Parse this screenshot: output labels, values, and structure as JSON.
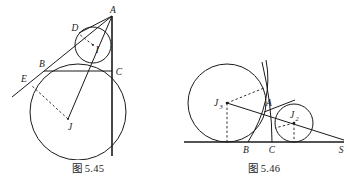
{
  "figures": [
    {
      "id": "figure-5-45",
      "caption": "图 5.45",
      "labels": {
        "A": "A",
        "B": "B",
        "C": "C",
        "D": "D",
        "E": "E",
        "I": "I",
        "J": "J"
      }
    },
    {
      "id": "figure-5-46",
      "caption": "图 5.46",
      "labels": {
        "A": "A",
        "B": "B",
        "C": "C",
        "S": "S",
        "J3_base": "J",
        "J3_sub": "3",
        "J2_base": "J",
        "J2_sub": "2"
      }
    }
  ],
  "colors": {
    "ink": "#1a1a1a",
    "paper": "#ffffff"
  }
}
